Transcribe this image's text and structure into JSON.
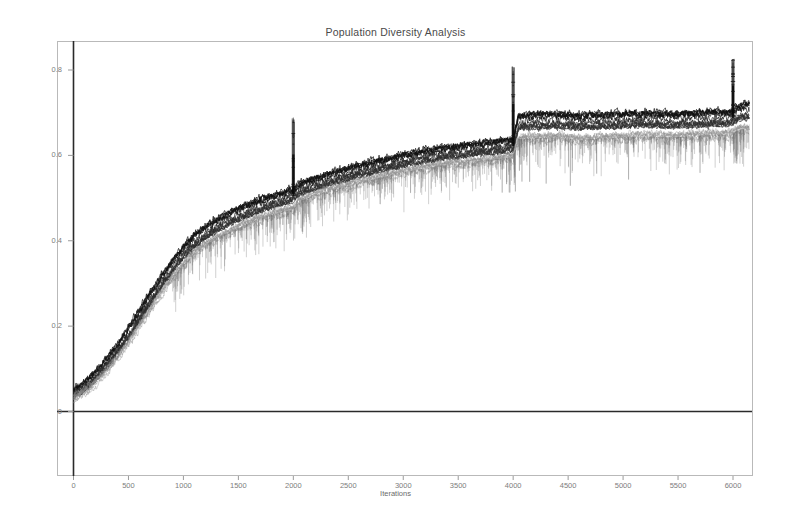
{
  "chart_data": {
    "type": "line",
    "title": "Population Diversity Analysis",
    "xlabel": "Iterations",
    "ylabel": "",
    "grid": false,
    "legend": null,
    "xlim": [
      0,
      6250
    ],
    "ylim": [
      -0.08,
      0.87
    ],
    "xticks": [
      0,
      500,
      1000,
      1500,
      2000,
      2500,
      3000,
      3500,
      4000,
      4500,
      5000,
      5500,
      6000
    ],
    "xtick_labels": [
      "0",
      "500",
      "1000",
      "1500",
      "2000",
      "2500",
      "3000",
      "3500",
      "4000",
      "4500",
      "5000",
      "5500",
      "6000"
    ],
    "yticks": [
      0,
      0.2,
      0.4,
      0.6,
      0.8
    ],
    "ytick_labels": [
      "0",
      "0.2",
      "0.4",
      "0.6",
      "0.8"
    ],
    "annotations": [
      {
        "label": "restart-spike",
        "x": 2000,
        "y_peak": 0.69
      },
      {
        "label": "restart-spike",
        "x": 4000,
        "y_peak": 0.81
      },
      {
        "label": "restart-spike",
        "x": 6000,
        "y_peak": 0.83
      }
    ],
    "series": [
      {
        "name": "upper-envelope",
        "color": "#101010",
        "x": [
          0,
          100,
          200,
          300,
          400,
          500,
          600,
          700,
          800,
          900,
          1000,
          1100,
          1200,
          1300,
          1400,
          1500,
          1600,
          1700,
          1800,
          1900,
          2000,
          2050,
          2200,
          2400,
          2600,
          2800,
          3000,
          3200,
          3400,
          3600,
          3800,
          3950,
          4000,
          4050,
          4200,
          4400,
          4600,
          4800,
          5000,
          5200,
          5400,
          5600,
          5800,
          5950,
          6000,
          6050,
          6150
        ],
        "values": [
          0.045,
          0.062,
          0.088,
          0.118,
          0.152,
          0.19,
          0.232,
          0.272,
          0.312,
          0.348,
          0.382,
          0.408,
          0.428,
          0.444,
          0.458,
          0.47,
          0.482,
          0.492,
          0.5,
          0.508,
          0.516,
          0.528,
          0.542,
          0.558,
          0.572,
          0.584,
          0.596,
          0.606,
          0.614,
          0.62,
          0.626,
          0.63,
          0.632,
          0.688,
          0.69,
          0.692,
          0.688,
          0.69,
          0.692,
          0.694,
          0.692,
          0.694,
          0.696,
          0.696,
          0.698,
          0.712,
          0.714
        ]
      },
      {
        "name": "median-band",
        "color": "#2e2e2e",
        "x": [
          0,
          100,
          200,
          300,
          400,
          500,
          600,
          700,
          800,
          900,
          1000,
          1100,
          1200,
          1300,
          1400,
          1500,
          1600,
          1700,
          1800,
          1900,
          2000,
          2050,
          2200,
          2400,
          2600,
          2800,
          3000,
          3200,
          3400,
          3600,
          3800,
          3950,
          4000,
          4050,
          4200,
          4400,
          4600,
          4800,
          5000,
          5200,
          5400,
          5600,
          5800,
          5950,
          6000,
          6050,
          6150
        ],
        "values": [
          0.038,
          0.054,
          0.078,
          0.106,
          0.14,
          0.176,
          0.216,
          0.256,
          0.296,
          0.332,
          0.364,
          0.39,
          0.41,
          0.426,
          0.44,
          0.452,
          0.464,
          0.474,
          0.482,
          0.49,
          0.498,
          0.512,
          0.526,
          0.542,
          0.556,
          0.568,
          0.58,
          0.59,
          0.598,
          0.604,
          0.61,
          0.614,
          0.616,
          0.668,
          0.67,
          0.672,
          0.668,
          0.67,
          0.672,
          0.674,
          0.672,
          0.674,
          0.676,
          0.676,
          0.678,
          0.69,
          0.692
        ]
      },
      {
        "name": "lower-envelope",
        "color": "#8e8e8e",
        "x": [
          0,
          100,
          200,
          300,
          400,
          500,
          600,
          700,
          800,
          900,
          1000,
          1100,
          1200,
          1300,
          1400,
          1500,
          1600,
          1700,
          1800,
          1900,
          2000,
          2050,
          2200,
          2400,
          2600,
          2800,
          3000,
          3200,
          3400,
          3600,
          3800,
          3950,
          4000,
          4050,
          4200,
          4400,
          4600,
          4800,
          5000,
          5200,
          5400,
          5600,
          5800,
          5950,
          6000,
          6050,
          6150
        ],
        "values": [
          0.03,
          0.044,
          0.066,
          0.094,
          0.126,
          0.16,
          0.198,
          0.238,
          0.276,
          0.312,
          0.344,
          0.37,
          0.39,
          0.406,
          0.418,
          0.43,
          0.442,
          0.452,
          0.46,
          0.468,
          0.474,
          0.492,
          0.506,
          0.522,
          0.536,
          0.548,
          0.56,
          0.57,
          0.578,
          0.584,
          0.59,
          0.594,
          0.596,
          0.638,
          0.64,
          0.642,
          0.636,
          0.64,
          0.642,
          0.644,
          0.642,
          0.644,
          0.648,
          0.648,
          0.65,
          0.66,
          0.662
        ]
      }
    ]
  }
}
